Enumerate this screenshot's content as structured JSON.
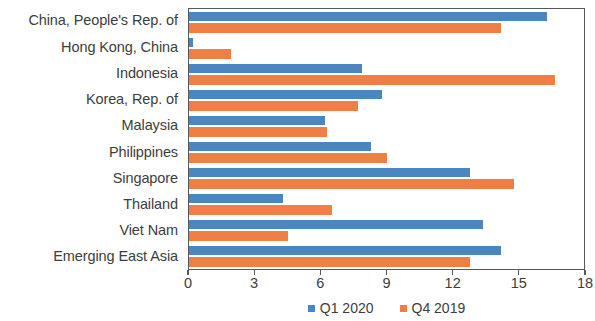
{
  "chart_data": {
    "type": "bar",
    "orientation": "horizontal",
    "title": "",
    "subtitle": "",
    "xlabel": "",
    "ylabel": "",
    "xlim": [
      0,
      18
    ],
    "xticks": [
      0,
      3,
      6,
      9,
      12,
      15,
      18
    ],
    "xtick_labels": [
      "0",
      "3",
      "6",
      "9",
      "12",
      "15",
      "18"
    ],
    "grid": false,
    "legend_position": "bottom",
    "categories": [
      "China, People's Rep. of",
      "Hong Kong, China",
      "Indonesia",
      "Korea, Rep. of",
      "Malaysia",
      "Philippines",
      "Singapore",
      "Thailand",
      "Viet Nam",
      "Emerging East Asia"
    ],
    "series": [
      {
        "name": "Q1 2020",
        "color": "#4a86c0",
        "values": [
          16.3,
          0.2,
          7.9,
          8.8,
          6.2,
          8.3,
          12.8,
          4.3,
          13.4,
          14.2
        ]
      },
      {
        "name": "Q4 2019",
        "color": "#ef7f45",
        "values": [
          14.2,
          1.9,
          16.7,
          7.7,
          6.3,
          9.0,
          14.8,
          6.5,
          4.5,
          12.8
        ]
      }
    ]
  },
  "legend": {
    "items": [
      {
        "label": "Q1 2020",
        "color": "#4a86c0"
      },
      {
        "label": "Q4 2019",
        "color": "#ef7f45"
      }
    ]
  }
}
